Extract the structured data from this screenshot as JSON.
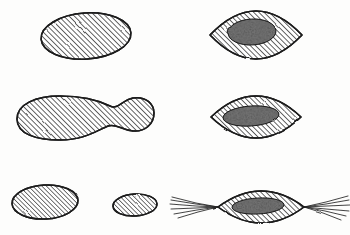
{
  "figure": {
    "background_color": "#fdfdfc",
    "ink_color": "#1b1b1b",
    "hatch_color": "#2a2a2a",
    "nucleus_color": "#2b2b2b",
    "width": 350,
    "height": 235,
    "columns": 2,
    "rows": 3,
    "panel_count": 7
  },
  "hatching": {
    "angle_label": "45",
    "spacing_label": "2.6",
    "stroke_width_label": "0.9",
    "direction": "lower-left to upper-right"
  },
  "panels": [
    {
      "id": "panel-top-left",
      "name": "plain-ellipse-large",
      "shape": "ellipse",
      "row": 1,
      "column": 1,
      "cx": 86,
      "cy": 36,
      "rx": 45,
      "ry": 23,
      "rotation": -4,
      "has_nucleus": false,
      "has_fibers": false
    },
    {
      "id": "panel-top-right",
      "name": "spindle-with-round-nucleus",
      "shape": "lens",
      "row": 1,
      "column": 2,
      "cx": 256,
      "cy": 35,
      "rx": 46,
      "ry": 22,
      "rotation": 0,
      "has_nucleus": true,
      "nucleus": {
        "cx": 252,
        "cy": 32,
        "rx": 24,
        "ry": 13,
        "rotation": -3
      },
      "has_fibers": false
    },
    {
      "id": "panel-middle-left",
      "name": "dumbbell-constricted-cell",
      "shape": "dumbbell",
      "row": 2,
      "column": 1,
      "cx": 72,
      "cy": 117,
      "has_nucleus": false,
      "has_fibers": false
    },
    {
      "id": "panel-middle-right",
      "name": "spindle-with-elongated-nucleus",
      "shape": "lens",
      "row": 2,
      "column": 2,
      "cx": 256,
      "cy": 117,
      "rx": 45,
      "ry": 21,
      "rotation": 0,
      "has_nucleus": true,
      "nucleus": {
        "cx": 251,
        "cy": 116,
        "rx": 28,
        "ry": 10,
        "rotation": -4
      },
      "has_fibers": false
    },
    {
      "id": "panel-bottom-left-a",
      "name": "plain-ellipse-medium",
      "shape": "ellipse",
      "row": 3,
      "column": 1,
      "cx": 45,
      "cy": 202,
      "rx": 33,
      "ry": 17,
      "rotation": -3,
      "has_nucleus": false,
      "has_fibers": false
    },
    {
      "id": "panel-bottom-left-b",
      "name": "plain-ellipse-small",
      "shape": "ellipse",
      "row": 3,
      "column": 1,
      "cx": 135,
      "cy": 205,
      "rx": 22,
      "ry": 11,
      "rotation": -3,
      "has_nucleus": false,
      "has_fibers": false
    },
    {
      "id": "panel-bottom-right",
      "name": "spindle-with-tendon-fibers",
      "shape": "lens",
      "row": 3,
      "column": 2,
      "cx": 261,
      "cy": 207,
      "rx": 43,
      "ry": 16,
      "rotation": 0,
      "has_nucleus": true,
      "nucleus": {
        "cx": 258,
        "cy": 206,
        "rx": 26,
        "ry": 8,
        "rotation": -3
      },
      "has_fibers": true,
      "fibers": {
        "left_count": 6,
        "right_count": 6,
        "left_tip_x": 218,
        "right_tip_x": 304,
        "tip_y": 207,
        "left_extent_x": 170,
        "right_extent_x": 348,
        "spread": 9
      }
    }
  ]
}
